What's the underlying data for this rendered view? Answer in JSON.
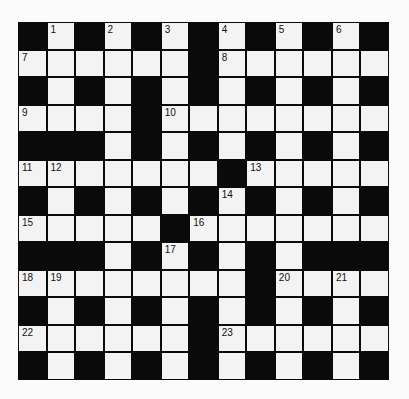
{
  "puzzle": {
    "type": "crossword",
    "rows": 13,
    "cols": 13,
    "colors": {
      "block": "#0a0a0a",
      "cell": "#f3f3f3",
      "background": "#fbfbfb",
      "number": "#111111"
    },
    "layout": [
      "#.#.#.#.#.#.#",
      "......#......",
      "#.#.#.#.#.#.#",
      "....#........",
      "###.#.#.#.#.#",
      ".......#.....",
      "#.#.#.#.#.#.#",
      ".....#.......",
      "###.#.#.#.###",
      "........#....",
      "#.#.#.#.#.#.#",
      "......#......",
      "#.#.#.#.#.#.#"
    ],
    "numbers": [
      {
        "row": 0,
        "col": 1,
        "n": "1"
      },
      {
        "row": 0,
        "col": 3,
        "n": "2"
      },
      {
        "row": 0,
        "col": 5,
        "n": "3"
      },
      {
        "row": 0,
        "col": 7,
        "n": "4"
      },
      {
        "row": 0,
        "col": 9,
        "n": "5"
      },
      {
        "row": 0,
        "col": 11,
        "n": "6"
      },
      {
        "row": 1,
        "col": 0,
        "n": "7"
      },
      {
        "row": 1,
        "col": 7,
        "n": "8"
      },
      {
        "row": 3,
        "col": 0,
        "n": "9"
      },
      {
        "row": 3,
        "col": 5,
        "n": "10"
      },
      {
        "row": 5,
        "col": 0,
        "n": "11"
      },
      {
        "row": 5,
        "col": 1,
        "n": "12"
      },
      {
        "row": 5,
        "col": 8,
        "n": "13"
      },
      {
        "row": 6,
        "col": 7,
        "n": "14"
      },
      {
        "row": 7,
        "col": 0,
        "n": "15"
      },
      {
        "row": 7,
        "col": 6,
        "n": "16"
      },
      {
        "row": 8,
        "col": 5,
        "n": "17"
      },
      {
        "row": 9,
        "col": 0,
        "n": "18"
      },
      {
        "row": 9,
        "col": 1,
        "n": "19"
      },
      {
        "row": 9,
        "col": 9,
        "n": "20"
      },
      {
        "row": 9,
        "col": 11,
        "n": "21"
      },
      {
        "row": 11,
        "col": 0,
        "n": "22"
      },
      {
        "row": 11,
        "col": 7,
        "n": "23"
      }
    ]
  }
}
